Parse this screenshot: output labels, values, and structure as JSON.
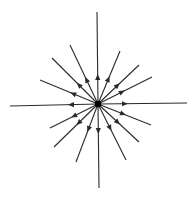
{
  "diagram": {
    "line_color": "#2a2a2a",
    "center_color": "#000000",
    "arrow_direction": "outward",
    "line_count": 16,
    "center_label": "",
    "lines": [
      {
        "name": "up"
      },
      {
        "name": "down"
      },
      {
        "name": "left"
      },
      {
        "name": "right"
      },
      {
        "name": "upper-left-1"
      },
      {
        "name": "upper-left-2"
      },
      {
        "name": "upper-left-3"
      },
      {
        "name": "upper-right-1"
      },
      {
        "name": "upper-right-2"
      },
      {
        "name": "upper-right-3"
      },
      {
        "name": "lower-left-1"
      },
      {
        "name": "lower-left-2"
      },
      {
        "name": "lower-left-3"
      },
      {
        "name": "lower-right-1"
      },
      {
        "name": "lower-right-2"
      },
      {
        "name": "lower-right-3"
      }
    ]
  }
}
